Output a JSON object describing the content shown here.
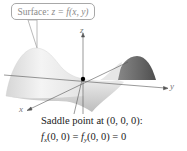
{
  "figure": {
    "callout": {
      "prefix": "Surface: ",
      "equation": "z = f(x, y)"
    },
    "axes": {
      "x": "x",
      "y": "y",
      "z": "z"
    },
    "point": {
      "label": "Saddle point at (0, 0, 0):",
      "coordinates": [
        0,
        0,
        0
      ]
    },
    "partials": {
      "fx": "f",
      "fx_sub": "x",
      "fx_args": "(0, 0) = ",
      "fy": "f",
      "fy_sub": "y",
      "fy_args": "(0, 0) = 0"
    },
    "colors": {
      "surface_light": "#f2f2f2",
      "surface_mid": "#c9c9c9",
      "surface_dark": "#6f6f6f",
      "axis": "#555555",
      "point": "#000000"
    }
  }
}
